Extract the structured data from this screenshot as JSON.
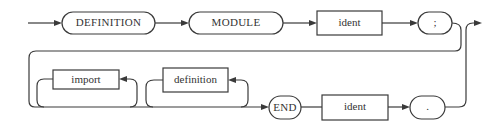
{
  "diagram": {
    "type": "syntax-railroad",
    "row1": {
      "terminals": [
        {
          "id": "t-definition",
          "label": "DEFINITION",
          "kind": "terminal"
        },
        {
          "id": "t-module",
          "label": "MODULE",
          "kind": "terminal"
        },
        {
          "id": "nt-ident-1",
          "label": "ident",
          "kind": "nonterminal"
        },
        {
          "id": "t-semicolon",
          "label": ";",
          "kind": "terminal"
        }
      ]
    },
    "row2": {
      "terminals": [
        {
          "id": "nt-import",
          "label": "import",
          "kind": "nonterminal",
          "repeat": true
        },
        {
          "id": "nt-definition",
          "label": "definition",
          "kind": "nonterminal",
          "repeat": true
        },
        {
          "id": "t-end",
          "label": "END",
          "kind": "terminal"
        },
        {
          "id": "nt-ident-2",
          "label": "ident",
          "kind": "nonterminal"
        },
        {
          "id": "t-period",
          "label": ".",
          "kind": "terminal"
        }
      ]
    },
    "colors": {
      "stroke": "#3a3a3a",
      "text": "#333333",
      "background": "#ffffff"
    }
  }
}
